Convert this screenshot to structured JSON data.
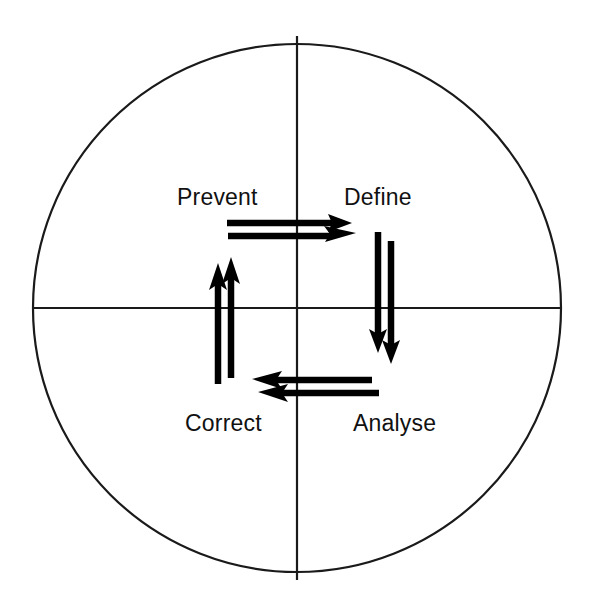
{
  "figure": {
    "background_color": "#ffffff",
    "line_color": "#1a1a1a",
    "arrow_color": "#000000"
  },
  "circle": {
    "center_x": 297,
    "center_y": 308,
    "radius": 264,
    "stroke_width": 2.2
  },
  "axes": {
    "vertical": {
      "x": 297,
      "y1": 36,
      "y2": 580
    },
    "horizontal": {
      "y": 308,
      "x1": 34,
      "x2": 561
    }
  },
  "quadrant_labels": [
    {
      "id": "prevent",
      "text": "Prevent",
      "x": 177,
      "y": 205,
      "quadrant": "top-left"
    },
    {
      "id": "define",
      "text": "Define",
      "x": 344,
      "y": 205,
      "quadrant": "top-right"
    },
    {
      "id": "correct",
      "text": "Correct",
      "x": 185,
      "y": 431,
      "quadrant": "bottom-left"
    },
    {
      "id": "analyse",
      "text": "Analyse",
      "x": 353,
      "y": 431,
      "quadrant": "bottom-right"
    }
  ],
  "arrows": [
    {
      "id": "prevent-to-define-upper",
      "direction": "right",
      "from": [
        227,
        223
      ],
      "to": [
        348,
        223
      ]
    },
    {
      "id": "prevent-to-define-lower",
      "direction": "right",
      "from": [
        228,
        235
      ],
      "to": [
        352,
        235
      ]
    },
    {
      "id": "define-to-analyse-left",
      "direction": "down",
      "from": [
        378,
        232
      ],
      "to": [
        378,
        348
      ]
    },
    {
      "id": "define-to-analyse-right",
      "direction": "down",
      "from": [
        391,
        241
      ],
      "to": [
        391,
        359
      ]
    },
    {
      "id": "analyse-to-correct-upper",
      "direction": "left",
      "from": [
        372,
        380
      ],
      "to": [
        255,
        380
      ]
    },
    {
      "id": "analyse-to-correct-lower",
      "direction": "left",
      "from": [
        379,
        392
      ],
      "to": [
        261,
        392
      ]
    },
    {
      "id": "correct-to-prevent-left",
      "direction": "up",
      "from": [
        218,
        384
      ],
      "to": [
        218,
        266
      ]
    },
    {
      "id": "correct-to-prevent-right",
      "direction": "up",
      "from": [
        231,
        378
      ],
      "to": [
        231,
        259
      ]
    }
  ],
  "cycle_order": [
    "Prevent",
    "Define",
    "Analyse",
    "Correct"
  ]
}
